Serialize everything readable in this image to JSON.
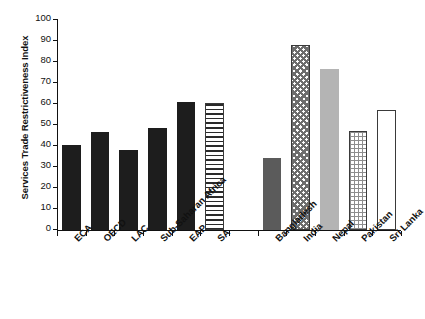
{
  "chart_data": {
    "type": "bar",
    "title": "",
    "xlabel": "",
    "ylabel": "Services Trade Restrictiveness Index",
    "ylim": [
      0,
      100
    ],
    "ytick_labels": [
      "100",
      "90",
      "80",
      "70",
      "60",
      "50",
      "40",
      "30",
      "20",
      "10",
      "0"
    ],
    "ytick_values": [
      100,
      90,
      80,
      70,
      60,
      50,
      40,
      30,
      20,
      10,
      0
    ],
    "grid": false,
    "legend": "none",
    "categories": [
      "ECA",
      "OECD",
      "LAC",
      "Sub-Saharan Africa",
      "EAP",
      "SA",
      "",
      "Bangladesh",
      "India",
      "Nepal",
      "Pakistan",
      "Sri Lanka"
    ],
    "values": [
      40.5,
      46.5,
      38.0,
      48.5,
      61.0,
      60.5,
      null,
      34.5,
      88.0,
      76.5,
      47.0,
      57.0
    ],
    "bars": [
      {
        "label": "ECA",
        "value": 40.5,
        "fill": "solid-black",
        "slot": 0
      },
      {
        "label": "OECD",
        "value": 46.5,
        "fill": "solid-black",
        "slot": 1
      },
      {
        "label": "LAC",
        "value": 38.0,
        "fill": "solid-black",
        "slot": 2
      },
      {
        "label": "Sub-Saharan Africa",
        "value": 48.5,
        "fill": "solid-black",
        "slot": 3
      },
      {
        "label": "EAP",
        "value": 61.0,
        "fill": "solid-black",
        "slot": 4
      },
      {
        "label": "SA",
        "value": 60.5,
        "fill": "hstripe",
        "slot": 5
      },
      {
        "label": "Bangladesh",
        "value": 34.5,
        "fill": "dark-gray",
        "slot": 7
      },
      {
        "label": "India",
        "value": 88.0,
        "fill": "checker",
        "slot": 8
      },
      {
        "label": "Nepal",
        "value": 76.5,
        "fill": "light-gray",
        "slot": 9
      },
      {
        "label": "Pakistan",
        "value": 47.0,
        "fill": "grid",
        "slot": 10
      },
      {
        "label": "Sri Lanka",
        "value": 57.0,
        "fill": "white",
        "slot": 11
      }
    ],
    "axis_colors": {
      "axis_line": "#111111",
      "tick_label": "#111111",
      "bar_solid": "#1d1d1d",
      "bar_dark_gray": "#5b5b5b",
      "bar_light_gray": "#b4b4b4",
      "bar_outline": "#3a3a3a"
    }
  }
}
